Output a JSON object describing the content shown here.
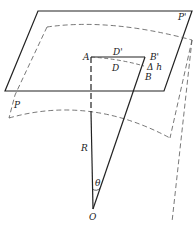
{
  "diagram": {
    "labels": {
      "P_prime": "P'",
      "P": "P",
      "A": "A",
      "D_prime": "D'",
      "D": "D",
      "B_prime": "B'",
      "delta_h": "Δ h",
      "B": "B",
      "R": "R",
      "theta": "θ",
      "O": "O"
    },
    "colors": {
      "line": "#222222",
      "dashed": "#444444",
      "background": "#ffffff"
    }
  }
}
